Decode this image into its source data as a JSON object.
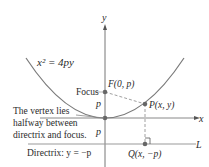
{
  "diagram": {
    "equation": "x² = 4py",
    "axis_x_label": "x",
    "axis_y_label": "y",
    "focus_label": "Focus",
    "focus_point": "F(0, p)",
    "point_p": "P(x, y)",
    "point_q": "Q(x, −p)",
    "directrix_line_label": "L",
    "p_upper": "p",
    "p_lower": "p",
    "vertex_note_lines": [
      "The vertex lies",
      "halfway between",
      "directrix and focus."
    ],
    "directrix_label": "Directrix: y = −p"
  },
  "colors": {
    "curve": "#7a7a7a",
    "axis": "#6a6a6a",
    "point": "#666666",
    "text": "#2a2a2a"
  }
}
